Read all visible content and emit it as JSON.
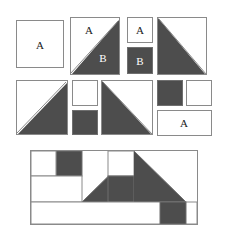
{
  "figure": {
    "colors": {
      "dark_fill": "#4d4d4d",
      "light_fill": "#ffffff",
      "stroke": "#8a8a8a",
      "label_dark": "#1a1a1a",
      "label_light": "#ffffff"
    },
    "labels": {
      "a1": "A",
      "a2": "A",
      "b1": "B",
      "a3": "A",
      "b2": "B",
      "a4": "A"
    },
    "rows": [
      {
        "name": "row-1",
        "tiles": [
          {
            "name": "square-a",
            "shape": "square",
            "fill": "light",
            "label": "A"
          },
          {
            "name": "split-square-ab",
            "shape": "diagonal-split",
            "light_label": "A",
            "dark_label": "B"
          },
          {
            "name": "small-square-a",
            "shape": "square",
            "fill": "light",
            "label": "A"
          },
          {
            "name": "small-square-b",
            "shape": "square",
            "fill": "dark",
            "label": "B"
          },
          {
            "name": "triangle-lower-left",
            "shape": "right-triangle",
            "fill": "dark"
          }
        ]
      },
      {
        "name": "row-2",
        "tiles": [
          {
            "name": "triangle-lower-right",
            "shape": "right-triangle",
            "fill": "dark"
          },
          {
            "name": "small-square-light",
            "shape": "square",
            "fill": "light"
          },
          {
            "name": "small-square-dark",
            "shape": "square",
            "fill": "dark"
          },
          {
            "name": "triangle-lower-left-2",
            "shape": "right-triangle",
            "fill": "dark"
          },
          {
            "name": "small-square-dark-2",
            "shape": "square",
            "fill": "dark"
          },
          {
            "name": "small-square-light-2",
            "shape": "square",
            "fill": "light"
          },
          {
            "name": "wide-rect-a",
            "shape": "rectangle",
            "fill": "light",
            "label": "A"
          }
        ]
      },
      {
        "name": "row-3-assembly",
        "tiles": [
          {
            "name": "assembly-outer-frame",
            "shape": "rectangle",
            "fill": "light"
          },
          {
            "name": "assembly-square-light-top-left",
            "shape": "square",
            "fill": "light"
          },
          {
            "name": "assembly-square-dark-top",
            "shape": "square",
            "fill": "dark"
          },
          {
            "name": "assembly-rect-light-mid-left",
            "shape": "rectangle",
            "fill": "light"
          },
          {
            "name": "assembly-triangle-center",
            "shape": "right-triangle",
            "fill": "dark"
          },
          {
            "name": "assembly-square-light-center",
            "shape": "square",
            "fill": "light"
          },
          {
            "name": "assembly-square-dark-center",
            "shape": "square",
            "fill": "dark"
          },
          {
            "name": "assembly-triangle-right",
            "shape": "right-triangle",
            "fill": "dark"
          },
          {
            "name": "assembly-square-dark-bottom",
            "shape": "square",
            "fill": "dark"
          },
          {
            "name": "assembly-rect-light-bottom",
            "shape": "rectangle",
            "fill": "light"
          }
        ]
      }
    ]
  }
}
